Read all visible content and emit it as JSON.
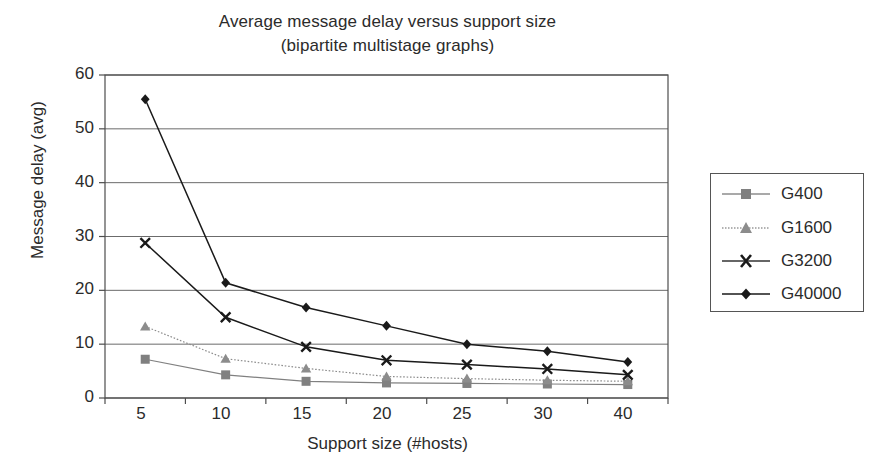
{
  "chart_data": {
    "type": "line",
    "title": "Average message delay versus support size",
    "subtitle": "(bipartite multistage graphs)",
    "xlabel": "Support size (#hosts)",
    "ylabel": "Message delay (avg)",
    "categories": [
      "5",
      "10",
      "15",
      "20",
      "25",
      "30",
      "40"
    ],
    "yticks": [
      "0",
      "10",
      "20",
      "30",
      "40",
      "50",
      "60"
    ],
    "ylim": [
      0,
      60
    ],
    "grid": "horizontal",
    "legend_position": "right-outside",
    "series": [
      {
        "name": "G400",
        "marker": "square",
        "color": "#808080",
        "line": "solid",
        "values": [
          7.2,
          4.3,
          3.1,
          2.8,
          2.7,
          2.6,
          2.5
        ]
      },
      {
        "name": "G1600",
        "marker": "triangle",
        "color": "#8c8c8c",
        "line": "dotted",
        "values": [
          13.3,
          7.3,
          5.5,
          4.0,
          3.6,
          3.3,
          3.1
        ]
      },
      {
        "name": "G3200",
        "marker": "cross",
        "color": "#1a1a1a",
        "line": "solid",
        "values": [
          28.8,
          15.0,
          9.5,
          7.0,
          6.2,
          5.4,
          4.3
        ]
      },
      {
        "name": "G40000",
        "marker": "diamond",
        "color": "#1a1a1a",
        "line": "solid",
        "values": [
          55.5,
          21.4,
          16.8,
          13.4,
          10.0,
          8.7,
          6.7
        ]
      }
    ]
  },
  "legend": {
    "items": [
      {
        "label": "G400"
      },
      {
        "label": "G1600"
      },
      {
        "label": "G3200"
      },
      {
        "label": "G40000"
      }
    ]
  }
}
